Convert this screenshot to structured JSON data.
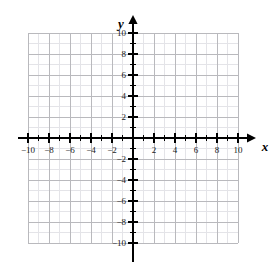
{
  "chart_data": {
    "type": "scatter",
    "title": "",
    "subtitle": "",
    "xlabel": "x",
    "ylabel": "y",
    "xlim": [
      -10,
      10
    ],
    "ylim": [
      -10,
      10
    ],
    "grid": true,
    "legend": null,
    "series": [],
    "x": [],
    "y": [],
    "annotations": [],
    "x_tick_labels": [
      "-10",
      "-8",
      "-6",
      "-4",
      "-2",
      "2",
      "4",
      "6",
      "8",
      "10"
    ],
    "x_tick_values": [
      -10,
      -8,
      -6,
      -4,
      -2,
      2,
      4,
      6,
      8,
      10
    ],
    "y_tick_labels": [
      "10",
      "8",
      "6",
      "4",
      "2",
      "-2",
      "-4",
      "-6",
      "-8",
      "-10"
    ],
    "y_tick_values": [
      10,
      8,
      6,
      4,
      2,
      -2,
      -4,
      -6,
      -8,
      -10
    ],
    "minor_tick_step": 1,
    "major_tick_step": 2,
    "origin_label": ""
  },
  "style": {
    "background": "#ffffff",
    "axis_color": "#000000",
    "grid_major_color": "#b9b9bd",
    "grid_minor_color": "#e4e4e8",
    "label_color": "#1a1a1a"
  },
  "axis_names": {
    "x": "x",
    "y": "y"
  }
}
